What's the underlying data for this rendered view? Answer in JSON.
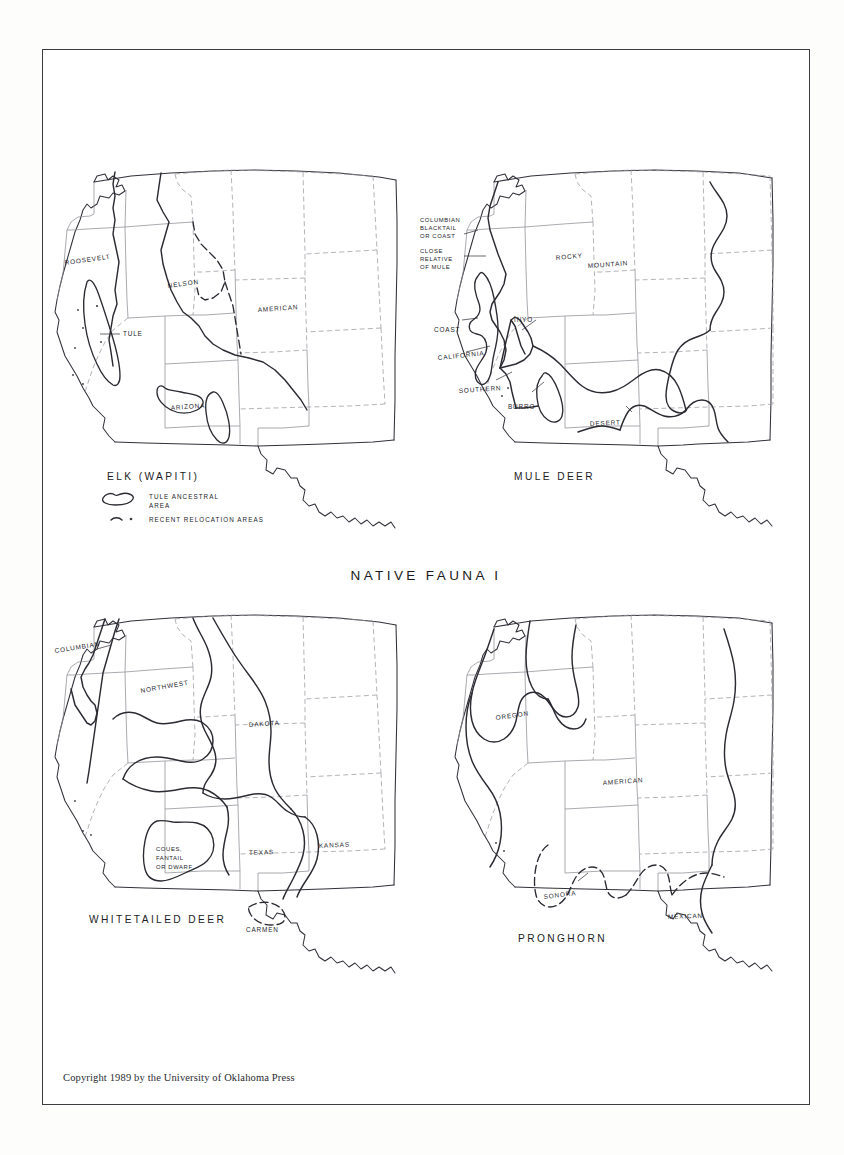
{
  "plate": {
    "title": "NATIVE FAUNA I",
    "copyright": "Copyright 1989 by the University of Oklahoma Press"
  },
  "maps": [
    {
      "id": "elk",
      "title": "ELK  (WAPITI)",
      "labels": [
        {
          "key": "roosevelt",
          "text": "ROOSEVELT"
        },
        {
          "key": "nelson",
          "text": "NELSON"
        },
        {
          "key": "american",
          "text": "AMERICAN"
        },
        {
          "key": "tule",
          "text": "TULE"
        },
        {
          "key": "arizona",
          "text": "ARIZONA"
        }
      ],
      "legend": [
        {
          "key": "tule-ancestral",
          "symbol": "blob",
          "line1": "TULE  ANCESTRAL",
          "line2": "AREA"
        },
        {
          "key": "recent-relocation",
          "symbol": "dash-dot",
          "line1": "RECENT  RELOCATION  AREAS",
          "line2": ""
        }
      ]
    },
    {
      "id": "mule-deer",
      "title": "MULE  DEER",
      "labels": [
        {
          "key": "columbian-blacktail",
          "text": "COLUMBIAN"
        },
        {
          "key": "columbian-blacktail-2",
          "text": "BLACKTAIL"
        },
        {
          "key": "columbian-blacktail-3",
          "text": "OR COAST"
        },
        {
          "key": "close-relative",
          "text": "CLOSE"
        },
        {
          "key": "close-relative-2",
          "text": "RELATIVE"
        },
        {
          "key": "close-relative-3",
          "text": "OF MULE"
        },
        {
          "key": "rocky",
          "text": "ROCKY"
        },
        {
          "key": "mountain",
          "text": "MOUNTAIN"
        },
        {
          "key": "inyo",
          "text": "INYO"
        },
        {
          "key": "coast",
          "text": "COAST"
        },
        {
          "key": "california",
          "text": "CALIFORNIA"
        },
        {
          "key": "southern",
          "text": "SOUTHERN"
        },
        {
          "key": "burro",
          "text": "BURRO"
        },
        {
          "key": "desert",
          "text": "DESERT"
        }
      ],
      "legend": []
    },
    {
      "id": "whitetailed-deer",
      "title": "WHITETAILED  DEER",
      "labels": [
        {
          "key": "columbian",
          "text": "COLUMBIAN"
        },
        {
          "key": "northwest",
          "text": "NORTHWEST"
        },
        {
          "key": "dakota",
          "text": "DAKOTA"
        },
        {
          "key": "kansas",
          "text": "KANSAS"
        },
        {
          "key": "texas",
          "text": "TEXAS"
        },
        {
          "key": "coues",
          "text": "COUES,"
        },
        {
          "key": "coues-2",
          "text": "FANTAIL"
        },
        {
          "key": "coues-3",
          "text": "OR DWARF"
        },
        {
          "key": "carmen",
          "text": "CARMEN"
        }
      ],
      "legend": []
    },
    {
      "id": "pronghorn",
      "title": "PRONGHORN",
      "labels": [
        {
          "key": "oregon",
          "text": "OREGON"
        },
        {
          "key": "american",
          "text": "AMERICAN"
        },
        {
          "key": "sonora",
          "text": "SONORA"
        },
        {
          "key": "mexican",
          "text": "MEXICAN"
        }
      ],
      "legend": []
    }
  ],
  "colors": {
    "ink": "#2b2b33",
    "state_line": "#8d8d96",
    "frame": "#3c3c40",
    "paper": "#ffffff"
  }
}
